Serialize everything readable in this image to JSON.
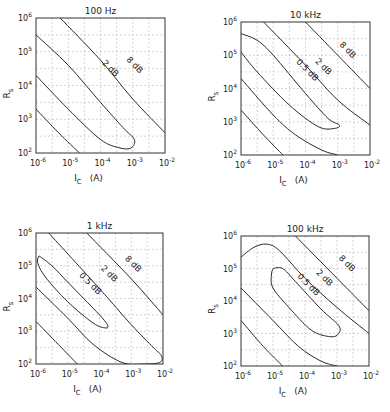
{
  "chart_data": [
    {
      "type": "line",
      "title": "100 Hz",
      "xlabel": "I_C (A)",
      "ylabel": "R_s",
      "xscale": "log",
      "yscale": "log",
      "xlim": [
        1e-06,
        0.01
      ],
      "ylim": [
        100.0,
        1000000.0
      ],
      "x_ticks": [
        "10^-6",
        "10^-5",
        "10^-4",
        "10^-3",
        "10^-2"
      ],
      "y_ticks": [
        "10^2",
        "10^3",
        "10^4",
        "10^5",
        "10^6"
      ],
      "grid": true,
      "frame": [
        36,
        18,
        165,
        153
      ],
      "series": [
        {
          "name": "8 dB",
          "label_pos": [
            -3.0,
            4.55
          ],
          "label_angle": 45,
          "points": [
            [
              -5.25,
              6.0
            ],
            [
              -4.0,
              4.75
            ],
            [
              -3.0,
              3.6
            ],
            [
              -2.0,
              2.6
            ]
          ]
        },
        {
          "name": "2 dB",
          "label_pos": [
            -3.75,
            4.45
          ],
          "label_angle": 45,
          "points": [
            [
              -6.0,
              5.5
            ],
            [
              -5.0,
              4.6
            ],
            [
              -4.0,
              3.5
            ],
            [
              -3.3,
              2.75
            ],
            [
              -2.95,
              2.4
            ],
            [
              -3.05,
              2.15
            ],
            [
              -3.4,
              2.15
            ],
            [
              -4.0,
              2.4
            ],
            [
              -5.0,
              3.3
            ],
            [
              -6.0,
              4.3
            ]
          ]
        },
        {
          "name": "",
          "points": [
            [
              -6.0,
              3.3
            ],
            [
              -5.3,
              2.6
            ],
            [
              -4.65,
              2.0
            ]
          ]
        }
      ]
    },
    {
      "type": "line",
      "title": "10 kHz",
      "xlabel": "I_C (A)",
      "ylabel": "R_s",
      "xscale": "log",
      "yscale": "log",
      "xlim": [
        1e-06,
        0.01
      ],
      "ylim": [
        100.0,
        1000000.0
      ],
      "x_ticks": [
        "10^-6",
        "10^-5",
        "10^-4",
        "10^-3",
        "10^-2"
      ],
      "y_ticks": [
        "10^2",
        "10^3",
        "10^4",
        "10^5",
        "10^6"
      ],
      "grid": true,
      "frame": [
        241,
        22,
        370,
        155
      ],
      "series": [
        {
          "name": "8 dB",
          "label_pos": [
            -2.75,
            5.1
          ],
          "label_angle": 45,
          "points": [
            [
              -4.0,
              6.0
            ],
            [
              -3.0,
              5.0
            ],
            [
              -2.0,
              4.0
            ]
          ]
        },
        {
          "name": "2 dB",
          "label_pos": [
            -3.5,
            4.6
          ],
          "label_angle": 45,
          "points": [
            [
              -5.3,
              6.0
            ],
            [
              -4.0,
              4.7
            ],
            [
              -3.0,
              3.65
            ],
            [
              -2.0,
              2.9
            ]
          ]
        },
        {
          "name": "0.5 dB",
          "label_pos": [
            -4.0,
            4.5
          ],
          "label_angle": 45,
          "points": [
            [
              -6.0,
              5.65
            ],
            [
              -5.5,
              5.45
            ],
            [
              -5.0,
              5.0
            ],
            [
              -4.0,
              3.85
            ],
            [
              -3.3,
              3.1
            ],
            [
              -2.95,
              2.9
            ],
            [
              -3.1,
              2.8
            ],
            [
              -3.6,
              2.85
            ],
            [
              -4.5,
              3.5
            ],
            [
              -5.5,
              4.5
            ],
            [
              -6.0,
              5.1
            ]
          ]
        },
        {
          "name": "",
          "points": [
            [
              -6.0,
              4.3
            ],
            [
              -5.0,
              3.2
            ],
            [
              -4.3,
              2.6
            ],
            [
              -3.5,
              2.15
            ],
            [
              -3.0,
              2.0
            ]
          ]
        },
        {
          "name": "",
          "points": [
            [
              -6.0,
              3.35
            ],
            [
              -5.3,
              2.6
            ],
            [
              -4.7,
              2.0
            ]
          ]
        }
      ]
    },
    {
      "type": "line",
      "title": "1 kHz",
      "xlabel": "I_C (A)",
      "ylabel": "R_s",
      "xscale": "log",
      "yscale": "log",
      "xlim": [
        1e-06,
        0.01
      ],
      "ylim": [
        100.0,
        1000000.0
      ],
      "x_ticks": [
        "10^-6",
        "10^-5",
        "10^-4",
        "10^-3",
        "10^-2"
      ],
      "y_ticks": [
        "10^2",
        "10^3",
        "10^4",
        "10^5",
        "10^6"
      ],
      "grid": true,
      "frame": [
        36,
        233,
        163,
        364
      ],
      "series": [
        {
          "name": "8 dB",
          "label_pos": [
            -3.0,
            5.0
          ],
          "label_angle": 45,
          "points": [
            [
              -4.4,
              6.0
            ],
            [
              -3.0,
              4.6
            ],
            [
              -2.0,
              3.5
            ]
          ]
        },
        {
          "name": "2 dB",
          "label_pos": [
            -3.75,
            4.7
          ],
          "label_angle": 45,
          "points": [
            [
              -5.6,
              6.0
            ],
            [
              -4.0,
              4.3
            ],
            [
              -3.0,
              3.2
            ],
            [
              -2.3,
              2.5
            ],
            [
              -2.05,
              2.25
            ],
            [
              -2.1,
              2.05
            ],
            [
              -2.6,
              2.0
            ],
            [
              -3.3,
              2.05
            ],
            [
              -4.2,
              2.6
            ],
            [
              -5.0,
              3.4
            ],
            [
              -6.0,
              4.35
            ]
          ]
        },
        {
          "name": "0.5 dB",
          "label_pos": [
            -4.35,
            4.4
          ],
          "label_angle": 45,
          "points": [
            [
              -5.9,
              5.3
            ],
            [
              -5.5,
              5.0
            ],
            [
              -5.0,
              4.5
            ],
            [
              -4.5,
              4.0
            ],
            [
              -4.0,
              3.5
            ],
            [
              -3.75,
              3.2
            ],
            [
              -3.8,
              3.1
            ],
            [
              -4.2,
              3.25
            ],
            [
              -5.0,
              3.9
            ],
            [
              -5.7,
              4.65
            ],
            [
              -5.95,
              5.1
            ],
            [
              -5.9,
              5.3
            ]
          ]
        },
        {
          "name": "",
          "points": [
            [
              -6.0,
              3.3
            ],
            [
              -5.3,
              2.6
            ],
            [
              -4.7,
              2.0
            ]
          ]
        }
      ]
    },
    {
      "type": "line",
      "title": "100 kHz",
      "xlabel": "I_C (A)",
      "ylabel": "R_s",
      "xscale": "log",
      "yscale": "log",
      "xlim": [
        1e-06,
        0.01
      ],
      "ylim": [
        100.0,
        1000000.0
      ],
      "x_ticks": [
        "10^-6",
        "10^-5",
        "10^-4",
        "10^-3",
        "10^-2"
      ],
      "y_ticks": [
        "10^2",
        "10^3",
        "10^4",
        "10^5",
        "10^6"
      ],
      "grid": true,
      "frame": [
        241,
        236,
        369,
        366
      ],
      "series": [
        {
          "name": "8 dB",
          "label_pos": [
            -2.75,
            5.1
          ],
          "label_angle": 45,
          "points": [
            [
              -4.3,
              6.0
            ],
            [
              -3.0,
              4.7
            ],
            [
              -2.0,
              3.7
            ]
          ]
        },
        {
          "name": "2 dB",
          "label_pos": [
            -3.45,
            4.65
          ],
          "label_angle": 45,
          "points": [
            [
              -6.0,
              5.35
            ],
            [
              -5.6,
              5.65
            ],
            [
              -5.2,
              5.75
            ],
            [
              -4.8,
              5.55
            ],
            [
              -4.0,
              4.7
            ],
            [
              -3.0,
              3.8
            ],
            [
              -2.0,
              3.0
            ]
          ]
        },
        {
          "name": "0.5 dB",
          "label_pos": [
            -3.95,
            4.45
          ],
          "label_angle": 45,
          "points": [
            [
              -5.0,
              5.0
            ],
            [
              -4.7,
              5.0
            ],
            [
              -4.3,
              4.6
            ],
            [
              -3.5,
              3.75
            ],
            [
              -2.95,
              3.25
            ],
            [
              -2.95,
              3.0
            ],
            [
              -3.2,
              2.9
            ],
            [
              -3.8,
              3.1
            ],
            [
              -4.5,
              3.8
            ],
            [
              -5.0,
              4.4
            ],
            [
              -5.05,
              4.8
            ],
            [
              -5.0,
              5.0
            ]
          ]
        },
        {
          "name": "",
          "points": [
            [
              -6.0,
              4.4
            ],
            [
              -5.0,
              3.4
            ],
            [
              -4.2,
              2.6
            ],
            [
              -3.5,
              2.15
            ],
            [
              -3.0,
              2.0
            ]
          ]
        },
        {
          "name": "",
          "points": [
            [
              -6.0,
              3.4
            ],
            [
              -5.3,
              2.6
            ],
            [
              -4.7,
              2.0
            ]
          ]
        }
      ]
    }
  ],
  "panels": [
    {
      "title": "100 Hz",
      "xlabel_main": "I",
      "xlabel_sub": "C",
      "xlabel_unit": "(A)",
      "ylabel_main": "R",
      "ylabel_sub": "s"
    },
    {
      "title": "10  kHz",
      "xlabel_main": "I",
      "xlabel_sub": "C",
      "xlabel_unit": "(A)",
      "ylabel_main": "R",
      "ylabel_sub": "s"
    },
    {
      "title": "1 kHz",
      "xlabel_main": "I",
      "xlabel_sub": "C",
      "xlabel_unit": "(A)",
      "ylabel_main": "R",
      "ylabel_sub": "s"
    },
    {
      "title": "100 kHz",
      "xlabel_main": "I",
      "xlabel_sub": "C",
      "xlabel_unit": "(A)",
      "ylabel_main": "R",
      "ylabel_sub": "s"
    }
  ],
  "tick_text": {
    "x": [
      [
        "10",
        "-6"
      ],
      [
        "10",
        "-5"
      ],
      [
        "10",
        "-4"
      ],
      [
        "10",
        "-3"
      ],
      [
        "10",
        "-2"
      ]
    ],
    "y": [
      [
        "10",
        "2"
      ],
      [
        "10",
        "3"
      ],
      [
        "10",
        "4"
      ],
      [
        "10",
        "5"
      ],
      [
        "10",
        "6"
      ]
    ]
  }
}
